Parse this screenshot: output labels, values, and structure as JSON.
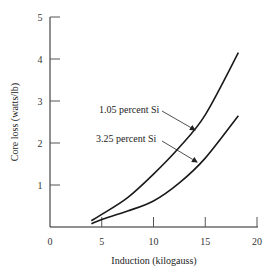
{
  "chart_data": {
    "type": "line",
    "title": "",
    "xlabel": "Induction (kilogauss)",
    "ylabel": "Core loss (watts/lb)",
    "xlim": [
      0,
      20
    ],
    "ylim": [
      0,
      5
    ],
    "x_ticks": [
      0,
      5,
      10,
      15,
      20
    ],
    "y_ticks": [
      1,
      2,
      3,
      4,
      5
    ],
    "x_tick_labels": [
      "0",
      "5",
      "10",
      "15",
      "20"
    ],
    "y_tick_labels": [
      "1",
      "2",
      "3",
      "4",
      "5"
    ],
    "grid": false,
    "legend": "none (inline annotations with arrows)",
    "series": [
      {
        "name": "1.05 percent Si",
        "x": [
          4,
          5,
          7.5,
          10,
          12.5,
          15,
          18.2
        ],
        "values": [
          0.15,
          0.3,
          0.7,
          1.26,
          1.9,
          2.67,
          4.15
        ]
      },
      {
        "name": "3.25 percent Si",
        "x": [
          4,
          5,
          7.5,
          10,
          12.5,
          15,
          18.2
        ],
        "values": [
          0.08,
          0.18,
          0.38,
          0.62,
          1.05,
          1.64,
          2.65
        ]
      }
    ],
    "annotations": [
      {
        "text": "1.05 percent Si",
        "points_to_series": 0
      },
      {
        "text": "3.25 percent Si",
        "points_to_series": 1
      }
    ]
  }
}
